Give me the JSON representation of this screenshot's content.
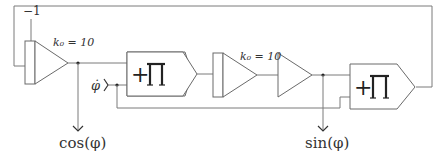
{
  "diagram": {
    "type": "block-diagram",
    "labels": {
      "neg_one": "−1",
      "gain1": "k₀ = 10",
      "gain2": "k₀ = 10",
      "phi_dot": "φ̇",
      "cos_out": "cos(φ)",
      "sin_out": "sin(φ)",
      "mult1_symbol": "+∏",
      "mult2_symbol": "+∏"
    },
    "blocks": [
      {
        "id": "amp-left",
        "kind": "summing-amplifier",
        "gain": "k₀ = 10",
        "extra_input": "−1"
      },
      {
        "id": "multiplier-1",
        "kind": "multiplier-integrator",
        "symbol": "+∏"
      },
      {
        "id": "amp-mid",
        "kind": "summing-amplifier",
        "gain": "k₀ = 10"
      },
      {
        "id": "buffer",
        "kind": "amplifier"
      },
      {
        "id": "multiplier-2",
        "kind": "multiplier-integrator",
        "symbol": "+∏"
      }
    ],
    "outputs": [
      "cos(φ)",
      "sin(φ)"
    ],
    "inputs": [
      "φ̇",
      "−1"
    ]
  }
}
